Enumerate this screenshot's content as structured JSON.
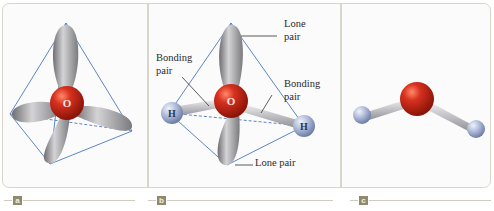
{
  "figure": {
    "panels": [
      {
        "tag": "a",
        "atom_center": "O",
        "description": "Tetrahedral arrangement of four electron pairs around oxygen"
      },
      {
        "tag": "b",
        "atom_center": "O",
        "atoms": [
          "H",
          "H"
        ],
        "labels": {
          "lone_pair_top": [
            "Lone",
            "pair"
          ],
          "bonding_left": [
            "Bonding",
            "pair"
          ],
          "bonding_right": [
            "Bonding",
            "pair"
          ],
          "lone_pair_bottom": "Lone pair"
        }
      },
      {
        "tag": "c",
        "description": "Bent ball-and-stick model of H2O"
      }
    ]
  },
  "colors": {
    "oxygen": "#c8261a",
    "hydrogen": "#a9b7d6",
    "lobe": "#a6a6a8",
    "tetra_line": "#4a78c0",
    "frame": "#d8d6cc",
    "tag_bg": "#8f8a6e"
  }
}
